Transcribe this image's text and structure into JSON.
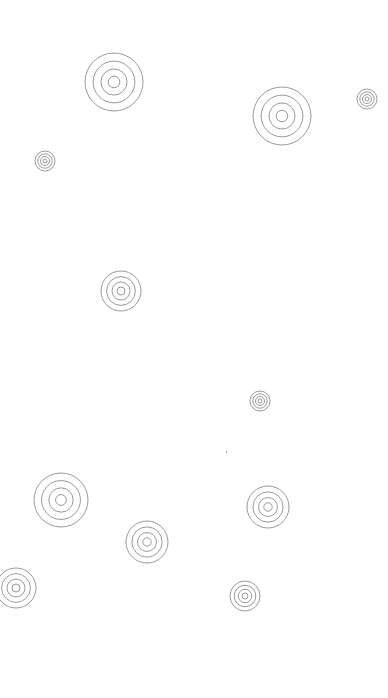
{
  "canvas": {
    "width": 388,
    "height": 698,
    "background": "#ffffff"
  },
  "style": {
    "stroke": "#9a9a9a",
    "stroke_width": 1,
    "ring_ratios": [
      1.0,
      0.72,
      0.45,
      0.2
    ]
  },
  "targets": [
    {
      "cx": 114,
      "cy": 82,
      "r": 29
    },
    {
      "cx": 282,
      "cy": 116,
      "r": 29
    },
    {
      "cx": 367,
      "cy": 99,
      "r": 10
    },
    {
      "cx": 45,
      "cy": 161,
      "r": 10
    },
    {
      "cx": 121,
      "cy": 291,
      "r": 20
    },
    {
      "cx": 260,
      "cy": 401,
      "r": 10
    },
    {
      "cx": 61,
      "cy": 500,
      "r": 27
    },
    {
      "cx": 268,
      "cy": 507,
      "r": 21
    },
    {
      "cx": 147,
      "cy": 542,
      "r": 21
    },
    {
      "cx": 16,
      "cy": 588,
      "r": 20
    },
    {
      "cx": 245,
      "cy": 596,
      "r": 15
    }
  ],
  "specks": [
    {
      "x": 226,
      "y": 451
    }
  ]
}
